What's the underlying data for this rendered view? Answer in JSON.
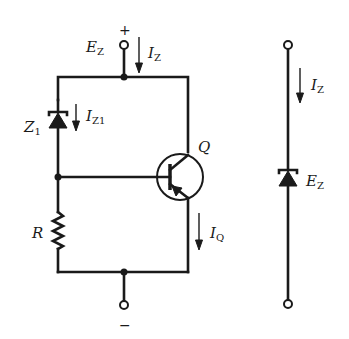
{
  "circuit": {
    "supply": {
      "plus_sign": "+",
      "minus_sign": "−",
      "voltage_label": "E",
      "voltage_sub": "Z",
      "current_label": "I",
      "current_sub": "Z"
    },
    "zener_z1": {
      "label": "Z",
      "label_sub": "1",
      "current_label": "I",
      "current_sub": "Z1"
    },
    "transistor": {
      "label": "Q",
      "type": "PNP",
      "current_label": "I",
      "current_sub": "Q"
    },
    "resistor": {
      "label": "R"
    }
  },
  "equivalent": {
    "current_label": "I",
    "current_sub": "Z",
    "voltage_label": "E",
    "voltage_sub": "Z"
  },
  "colors": {
    "ink": "#1a1a1a",
    "background": "#ffffff"
  }
}
